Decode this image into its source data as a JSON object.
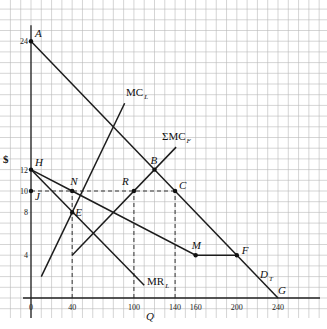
{
  "chart_data": {
    "type": "line",
    "title": "",
    "xlabel": "Q",
    "ylabel": "$",
    "xlim": [
      0,
      280
    ],
    "ylim": [
      0,
      27
    ],
    "grid": true,
    "x_ticks": [
      0,
      40,
      100,
      140,
      160,
      200,
      240
    ],
    "y_ticks": [
      4,
      8,
      10,
      12,
      24
    ],
    "series": [
      {
        "name": "D_T",
        "label": "D",
        "sub": "T",
        "points": [
          [
            0,
            24
          ],
          [
            240,
            0
          ]
        ]
      },
      {
        "name": "HNMF",
        "label": "",
        "points": [
          [
            0,
            12
          ],
          [
            40,
            10
          ],
          [
            160,
            4
          ],
          [
            200,
            4
          ]
        ]
      },
      {
        "name": "MR_L",
        "label": "MR",
        "sub": "L",
        "points": [
          [
            0,
            12
          ],
          [
            110,
            1.2
          ]
        ]
      },
      {
        "name": "MC_L",
        "label": "MC",
        "sub": "L",
        "points": [
          [
            10,
            2
          ],
          [
            91,
            18.2
          ]
        ]
      },
      {
        "name": "ΣMC_F",
        "label": "ΣMC",
        "sub": "F",
        "points": [
          [
            40,
            4
          ],
          [
            141,
            14.1
          ]
        ]
      }
    ],
    "dashed_lines": [
      {
        "points": [
          [
            40,
            0
          ],
          [
            40,
            10
          ]
        ]
      },
      {
        "points": [
          [
            100,
            0
          ],
          [
            100,
            10
          ]
        ]
      },
      {
        "points": [
          [
            140,
            0
          ],
          [
            140,
            10
          ]
        ]
      },
      {
        "points": [
          [
            0,
            10
          ],
          [
            140,
            10
          ]
        ]
      }
    ],
    "labeled_points": [
      {
        "name": "A",
        "x": 0,
        "y": 24,
        "dot": true
      },
      {
        "name": "B",
        "x": 120,
        "y": 12,
        "dot": true
      },
      {
        "name": "C",
        "x": 140,
        "y": 10,
        "dot": true
      },
      {
        "name": "E",
        "x": 40,
        "y": 8,
        "dot": true
      },
      {
        "name": "F",
        "x": 200,
        "y": 4,
        "dot": true
      },
      {
        "name": "G",
        "x": 240,
        "y": 0,
        "dot": false
      },
      {
        "name": "H",
        "x": 0,
        "y": 12,
        "dot": true
      },
      {
        "name": "J",
        "x": 0,
        "y": 10,
        "dot": true
      },
      {
        "name": "M",
        "x": 160,
        "y": 4,
        "dot": true
      },
      {
        "name": "N",
        "x": 40,
        "y": 10,
        "dot": true
      },
      {
        "name": "R",
        "x": 100,
        "y": 10,
        "dot": true
      }
    ]
  }
}
